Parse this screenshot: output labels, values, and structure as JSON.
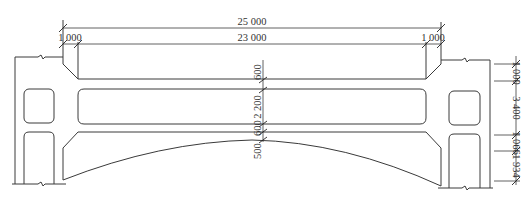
{
  "drawing": {
    "type": "bridge-frame-elevation",
    "line_color": "#3a3a3a",
    "background": "#ffffff"
  },
  "dimensions": {
    "horizontal": {
      "overall": "25 000",
      "clear_span": "23 000",
      "left_wall": "1 000",
      "right_wall": "1 000"
    },
    "center_vertical": {
      "top_slab": "600",
      "opening": "2 200",
      "lower_slab": "600",
      "crown": "500"
    },
    "right_vertical": {
      "seg1": "1 000",
      "seg2": "3 400",
      "seg3": "1 066",
      "seg4": "1 934"
    }
  }
}
